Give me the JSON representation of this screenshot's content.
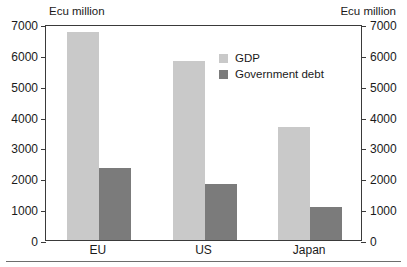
{
  "captions": {
    "unit_left": "Ecu million",
    "unit_right": "Ecu million"
  },
  "legend": {
    "position": "inside-top-right",
    "items": [
      {
        "label": "GDP",
        "color": "#c9c9c9",
        "swatch_name": "legend-swatch-gdp"
      },
      {
        "label": "Government debt",
        "color": "#7b7b7b",
        "swatch_name": "legend-swatch-government-debt"
      }
    ]
  },
  "axis": {
    "left_ticks": [
      "7000",
      "6000",
      "5000",
      "4000",
      "3000",
      "2000",
      "1000",
      "0"
    ],
    "right_ticks": [
      "7000",
      "6000",
      "5000",
      "4000",
      "3000",
      "2000",
      "1000",
      "0"
    ]
  },
  "chart_data": {
    "type": "bar",
    "title": "",
    "subtitle": "",
    "xlabel": "",
    "ylabel": "Ecu million",
    "y2label": "Ecu million",
    "categories": [
      "EU",
      "US",
      "Japan"
    ],
    "series": [
      {
        "name": "GDP",
        "color": "#c9c9c9",
        "values": [
          6750,
          5790,
          3650
        ]
      },
      {
        "name": "Government debt",
        "color": "#7b7b7b",
        "values": [
          2350,
          1830,
          1080
        ]
      }
    ],
    "ylim": [
      0,
      7000
    ],
    "y2lim": [
      0,
      7000
    ],
    "yticks": [
      0,
      1000,
      2000,
      3000,
      4000,
      5000,
      6000,
      7000
    ],
    "grid": false,
    "dual_axis": true,
    "legend_position": "inside-top-right"
  }
}
